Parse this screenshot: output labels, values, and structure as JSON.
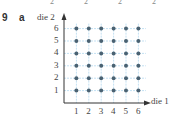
{
  "header": {
    "fraction_denominators": [
      "2",
      "2",
      "2",
      "2"
    ],
    "question_number": "9",
    "question_part": "a"
  },
  "chart_data": {
    "type": "scatter",
    "title": "",
    "xlabel": "die 1",
    "ylabel": "die 2",
    "x_ticks": [
      "1",
      "2",
      "3",
      "4",
      "5",
      "6"
    ],
    "y_ticks": [
      "1",
      "2",
      "3",
      "4",
      "5",
      "6"
    ],
    "xlim": [
      0,
      6.6
    ],
    "ylim": [
      0,
      6.6
    ],
    "grid": true,
    "points": [
      [
        1,
        1
      ],
      [
        2,
        1
      ],
      [
        3,
        1
      ],
      [
        4,
        1
      ],
      [
        5,
        1
      ],
      [
        6,
        1
      ],
      [
        1,
        2
      ],
      [
        2,
        2
      ],
      [
        3,
        2
      ],
      [
        4,
        2
      ],
      [
        5,
        2
      ],
      [
        6,
        2
      ],
      [
        1,
        3
      ],
      [
        2,
        3
      ],
      [
        3,
        3
      ],
      [
        4,
        3
      ],
      [
        5,
        3
      ],
      [
        6,
        3
      ],
      [
        1,
        4
      ],
      [
        2,
        4
      ],
      [
        3,
        4
      ],
      [
        4,
        4
      ],
      [
        5,
        4
      ],
      [
        6,
        4
      ],
      [
        1,
        5
      ],
      [
        2,
        5
      ],
      [
        3,
        5
      ],
      [
        4,
        5
      ],
      [
        5,
        5
      ],
      [
        6,
        5
      ],
      [
        1,
        6
      ],
      [
        2,
        6
      ],
      [
        3,
        6
      ],
      [
        4,
        6
      ],
      [
        5,
        6
      ],
      [
        6,
        6
      ]
    ],
    "colors": {
      "point": "#4a6272",
      "grid": "#a9d3ec",
      "axis": "#333333"
    }
  }
}
